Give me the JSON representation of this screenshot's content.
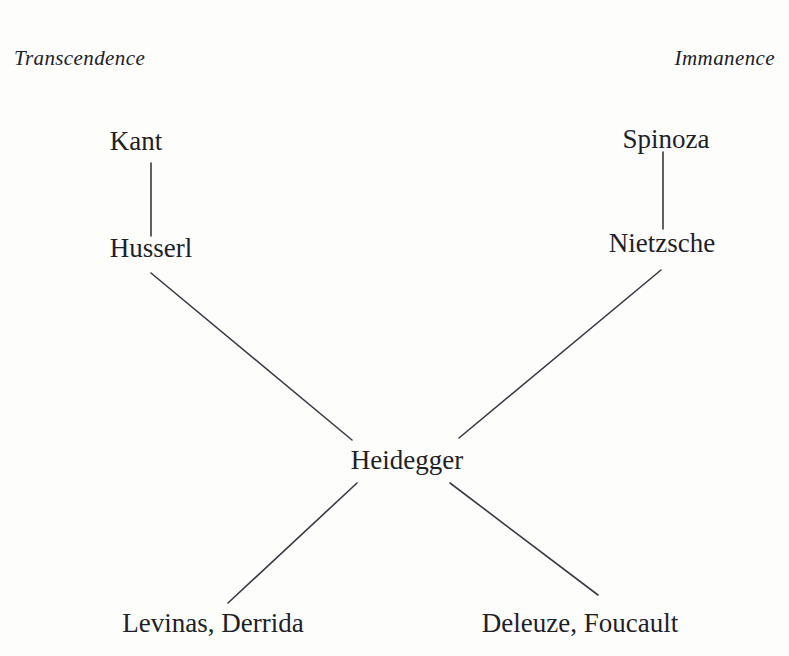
{
  "diagram": {
    "background_color": "#fdfdfb",
    "ink_color": "#1f1f28",
    "axis_labels": {
      "left": "Transcendence",
      "right": "Immanence"
    },
    "nodes": [
      {
        "id": "kant",
        "label": "Kant"
      },
      {
        "id": "husserl",
        "label": "Husserl"
      },
      {
        "id": "spinoza",
        "label": "Spinoza"
      },
      {
        "id": "nietzsche",
        "label": "Nietzsche"
      },
      {
        "id": "heidegger",
        "label": "Heidegger"
      },
      {
        "id": "levinas-derrida",
        "label": "Levinas, Derrida"
      },
      {
        "id": "deleuze-foucault",
        "label": "Deleuze, Foucault"
      }
    ],
    "edges": [
      {
        "from": "kant",
        "to": "husserl",
        "x1": 151,
        "y1": 163,
        "x2": 151,
        "y2": 236
      },
      {
        "from": "spinoza",
        "to": "nietzsche",
        "x1": 663,
        "y1": 152,
        "x2": 663,
        "y2": 229
      },
      {
        "from": "husserl",
        "to": "heidegger",
        "x1": 151,
        "y1": 273,
        "x2": 352,
        "y2": 440
      },
      {
        "from": "nietzsche",
        "to": "heidegger",
        "x1": 661,
        "y1": 270,
        "x2": 459,
        "y2": 438
      },
      {
        "from": "heidegger",
        "to": "levinas-derrida",
        "x1": 357,
        "y1": 483,
        "x2": 228,
        "y2": 603
      },
      {
        "from": "heidegger",
        "to": "deleuze-foucault",
        "x1": 450,
        "y1": 483,
        "x2": 598,
        "y2": 595
      }
    ]
  }
}
